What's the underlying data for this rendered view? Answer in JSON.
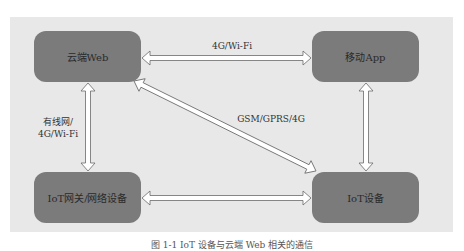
{
  "diagram": {
    "type": "network-architecture",
    "background_color": "#e8e8e8",
    "node_color": "#7b7b7b",
    "nodes": [
      {
        "id": "cloud-web",
        "label": "云端Web"
      },
      {
        "id": "mobile-app",
        "label": "移动App"
      },
      {
        "id": "iot-gateway",
        "label": "IoT网关/网络设备"
      },
      {
        "id": "iot-device",
        "label": "IoT设备"
      }
    ],
    "edges": [
      {
        "from": "cloud-web",
        "to": "mobile-app",
        "label": "4G/Wi-Fi",
        "bidirectional": true
      },
      {
        "from": "cloud-web",
        "to": "iot-gateway",
        "label": "有线网/\n4G/Wi-Fi",
        "label_line1": "有线网/",
        "label_line2": "4G/Wi-Fi",
        "bidirectional": true
      },
      {
        "from": "cloud-web",
        "to": "iot-device",
        "label": "GSM/GPRS/4G",
        "bidirectional": true
      },
      {
        "from": "mobile-app",
        "to": "iot-device",
        "label": "",
        "bidirectional": true
      },
      {
        "from": "iot-gateway",
        "to": "iot-device",
        "label": "",
        "bidirectional": true
      }
    ]
  },
  "caption": "图 1-1  IoT 设备与云端 Web 相关的通信"
}
